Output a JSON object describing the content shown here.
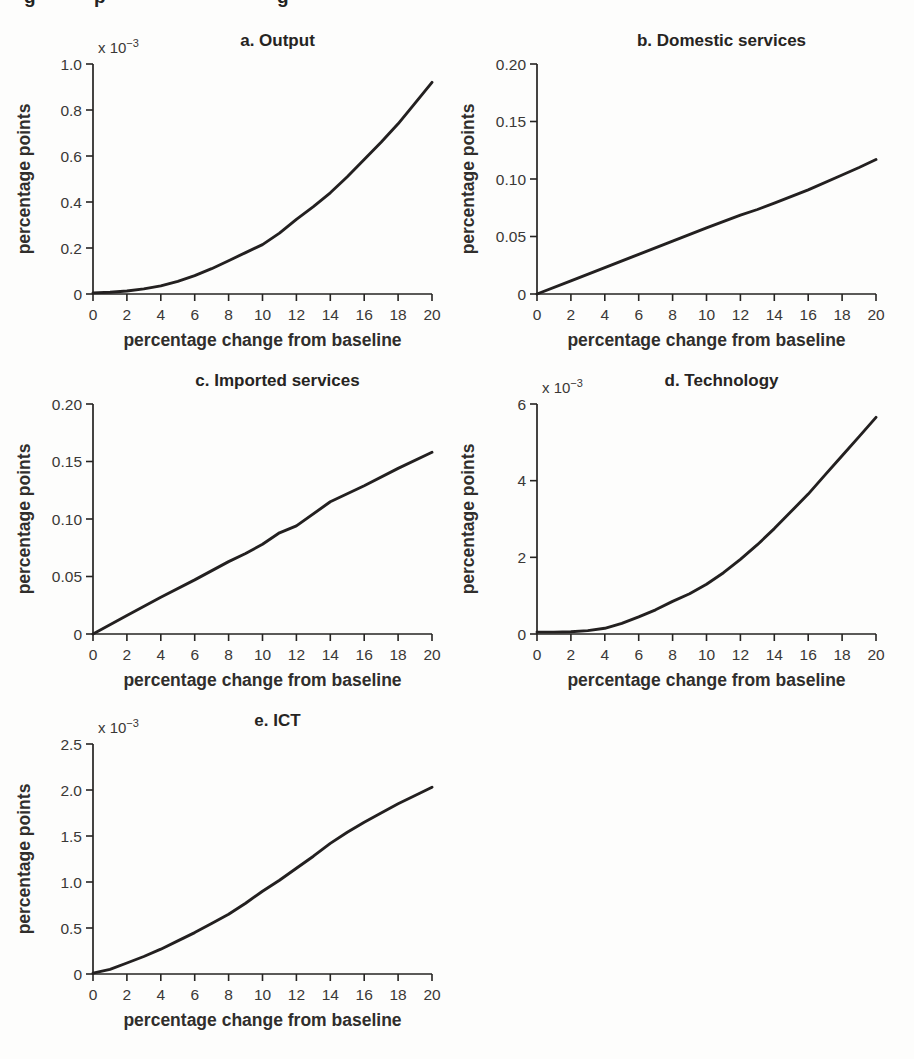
{
  "page": {
    "background": "#fdfdfc",
    "ink_color": "#232020",
    "cropped_caption_fragments": [
      {
        "char": "g",
        "left": 24
      },
      {
        "char": "p",
        "left": 94
      },
      {
        "char": "g",
        "left": 277
      }
    ]
  },
  "chart_data": [
    {
      "type": "line",
      "panel_id": "a",
      "title": "a. Output",
      "scale_label": "x 10^−3",
      "ylabel": "percentage points",
      "xlabel": "percentage change from baseline",
      "xlim": [
        0,
        20
      ],
      "ylim": [
        0,
        1.0
      ],
      "xticks": [
        0,
        2,
        4,
        6,
        8,
        10,
        12,
        14,
        16,
        18,
        20
      ],
      "ytick_values": [
        0,
        0.2,
        0.4,
        0.6,
        0.8,
        1.0
      ],
      "ytick_labels": [
        "0",
        "0.2",
        "0.4",
        "0.6",
        "0.8",
        "1.0"
      ],
      "x": [
        0,
        1,
        2,
        3,
        4,
        5,
        6,
        7,
        8,
        9,
        10,
        11,
        12,
        13,
        14,
        15,
        16,
        17,
        18,
        19,
        20
      ],
      "y": [
        0.005,
        0.008,
        0.013,
        0.022,
        0.035,
        0.055,
        0.08,
        0.11,
        0.145,
        0.18,
        0.215,
        0.265,
        0.325,
        0.38,
        0.44,
        0.51,
        0.585,
        0.66,
        0.74,
        0.83,
        0.92
      ]
    },
    {
      "type": "line",
      "panel_id": "b",
      "title": "b. Domestic services",
      "scale_label": null,
      "ylabel": "percentage points",
      "xlabel": "percentage change from baseline",
      "xlim": [
        0,
        20
      ],
      "ylim": [
        0,
        0.2
      ],
      "xticks": [
        0,
        2,
        4,
        6,
        8,
        10,
        12,
        14,
        16,
        18,
        20
      ],
      "ytick_values": [
        0,
        0.05,
        0.1,
        0.15,
        0.2
      ],
      "ytick_labels": [
        "0",
        "0.05",
        "0.10",
        "0.15",
        "0.20"
      ],
      "x": [
        0,
        2,
        4,
        6,
        8,
        10,
        12,
        13,
        14,
        16,
        18,
        19,
        20
      ],
      "y": [
        0.0,
        0.0115,
        0.023,
        0.0345,
        0.046,
        0.0575,
        0.0685,
        0.0735,
        0.079,
        0.0905,
        0.1035,
        0.11,
        0.117
      ]
    },
    {
      "type": "line",
      "panel_id": "c",
      "title": "c. Imported services",
      "scale_label": null,
      "ylabel": "percentage points",
      "xlabel": "percentage change from baseline",
      "xlim": [
        0,
        20
      ],
      "ylim": [
        0,
        0.2
      ],
      "xticks": [
        0,
        2,
        4,
        6,
        8,
        10,
        12,
        14,
        16,
        18,
        20
      ],
      "ytick_values": [
        0,
        0.05,
        0.1,
        0.15,
        0.2
      ],
      "ytick_labels": [
        "0",
        "0.05",
        "0.10",
        "0.15",
        "0.20"
      ],
      "x": [
        0,
        2,
        4,
        6,
        8,
        9,
        10,
        11,
        12,
        14,
        16,
        18,
        20
      ],
      "y": [
        0.0,
        0.016,
        0.032,
        0.047,
        0.063,
        0.07,
        0.078,
        0.088,
        0.094,
        0.115,
        0.129,
        0.144,
        0.158
      ]
    },
    {
      "type": "line",
      "panel_id": "d",
      "title": "d. Technology",
      "scale_label": "x 10^−3",
      "ylabel": "percentage points",
      "xlabel": "percentage change from baseline",
      "xlim": [
        0,
        20
      ],
      "ylim": [
        0,
        6
      ],
      "xticks": [
        0,
        2,
        4,
        6,
        8,
        10,
        12,
        14,
        16,
        18,
        20
      ],
      "ytick_values": [
        0,
        2,
        4,
        6
      ],
      "ytick_labels": [
        "0",
        "2",
        "4",
        "6"
      ],
      "x": [
        0,
        1,
        2,
        3,
        4,
        5,
        6,
        7,
        8,
        9,
        10,
        11,
        12,
        13,
        14,
        15,
        16,
        17,
        18,
        19,
        20
      ],
      "y": [
        0.05,
        0.05,
        0.06,
        0.09,
        0.15,
        0.28,
        0.45,
        0.63,
        0.85,
        1.05,
        1.3,
        1.6,
        1.95,
        2.33,
        2.75,
        3.2,
        3.65,
        4.15,
        4.65,
        5.15,
        5.65
      ]
    },
    {
      "type": "line",
      "panel_id": "e",
      "title": "e. ICT",
      "scale_label": "x 10^−3",
      "ylabel": "percentage points",
      "xlabel": "percentage change from baseline",
      "xlim": [
        0,
        20
      ],
      "ylim": [
        0,
        2.5
      ],
      "xticks": [
        0,
        2,
        4,
        6,
        8,
        10,
        12,
        14,
        16,
        18,
        20
      ],
      "ytick_values": [
        0,
        0.5,
        1.0,
        1.5,
        2.0,
        2.5
      ],
      "ytick_labels": [
        "0",
        "0.5",
        "1.0",
        "1.5",
        "2.0",
        "2.5"
      ],
      "x": [
        0,
        1,
        2,
        3,
        4,
        5,
        6,
        7,
        8,
        9,
        10,
        11,
        12,
        13,
        14,
        15,
        16,
        17,
        18,
        19,
        20
      ],
      "y": [
        0.01,
        0.05,
        0.12,
        0.19,
        0.27,
        0.36,
        0.45,
        0.55,
        0.65,
        0.77,
        0.9,
        1.02,
        1.15,
        1.28,
        1.42,
        1.54,
        1.65,
        1.75,
        1.85,
        1.94,
        2.03
      ]
    }
  ]
}
